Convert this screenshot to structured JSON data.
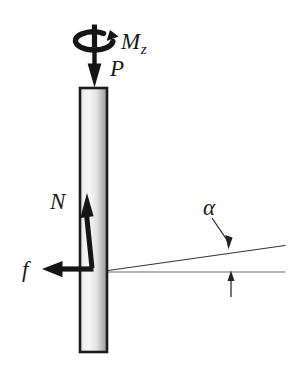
{
  "figure": {
    "type": "free-body-diagram",
    "background_color": "#ffffff",
    "ink_color": "#1a1a1a",
    "bar": {
      "name": "vertical-bar",
      "x": 80,
      "y": 88,
      "width": 27,
      "height": 264,
      "border_color": "#1c1c1c",
      "fill_light": "#f2f2f2",
      "fill_dark": "#9b9b9b"
    },
    "labels": {
      "torque": "M",
      "torque_subscript": "z",
      "axial_load": "P",
      "normal_force": "N",
      "friction_force": "f",
      "angle": "α"
    },
    "arrows": [
      {
        "name": "torque-arrow",
        "kind": "curved-rotation",
        "label": "Mz"
      },
      {
        "name": "axial-load-arrow",
        "kind": "straight-down",
        "label": "P"
      },
      {
        "name": "normal-force-arrow",
        "kind": "straight-up",
        "label": "N"
      },
      {
        "name": "friction-force-arrow",
        "kind": "straight-left",
        "label": "f"
      },
      {
        "name": "angle-pointer-upper",
        "kind": "thin-pointer",
        "label": "α"
      },
      {
        "name": "angle-pointer-lower",
        "kind": "thin-pointer",
        "label": ""
      }
    ],
    "lines": [
      {
        "name": "inclined-surface-line",
        "description": "inclined line rising to the right"
      },
      {
        "name": "horizontal-reference-line",
        "description": "horizontal reference line"
      }
    ]
  }
}
